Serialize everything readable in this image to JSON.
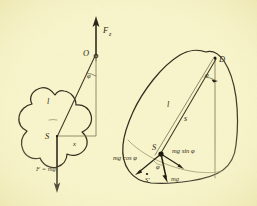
{
  "figure": {
    "background_color": "#f9f5cb",
    "ink_color": "#2f2a1a",
    "left_diagram": {
      "name": "upright-body-with-weight",
      "labels": {
        "support_force": "F",
        "support_force_sub": "z",
        "pivot_point": "O",
        "angle": "φ",
        "lever_arm": "l",
        "center_of_mass": "S",
        "horizontal_offset": "x",
        "weight": "F = mg"
      }
    },
    "right_diagram": {
      "name": "tilted-body-force-components",
      "labels": {
        "pivot_point": "D",
        "angle_top": "φ",
        "lever_arm": "l",
        "distance": "s",
        "center_of_mass": "S",
        "center_of_mass_shifted": "S'",
        "angle_at_s": "φ",
        "tangential_component": "mg sin φ",
        "normal_component": "mg cos φ",
        "weight": "mg"
      }
    }
  }
}
